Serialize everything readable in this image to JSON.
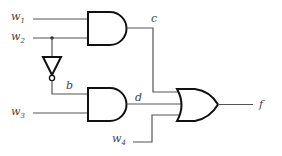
{
  "diagram": {
    "type": "logic-circuit",
    "inputs": [
      {
        "name": "w",
        "sub": "1"
      },
      {
        "name": "w",
        "sub": "2"
      },
      {
        "name": "w",
        "sub": "3"
      },
      {
        "name": "w",
        "sub": "4"
      }
    ],
    "signals": {
      "c": "c",
      "b": "b",
      "d": "d",
      "f": "f"
    },
    "gates": [
      {
        "id": "and1",
        "type": "AND",
        "inputs": [
          "w1",
          "w2"
        ],
        "output": "c"
      },
      {
        "id": "not1",
        "type": "NOT",
        "inputs": [
          "w2"
        ],
        "output": "b"
      },
      {
        "id": "and2",
        "type": "AND",
        "inputs": [
          "b",
          "w3"
        ],
        "output": "d"
      },
      {
        "id": "or1",
        "type": "OR",
        "inputs": [
          "c",
          "d",
          "w4"
        ],
        "output": "f"
      }
    ]
  }
}
